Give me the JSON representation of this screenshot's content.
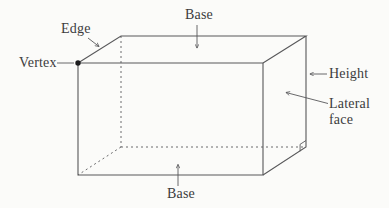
{
  "figure": {
    "type": "labeled-geometry-diagram",
    "labels": {
      "base_top": "Base",
      "edge": "Edge",
      "vertex": "Vertex",
      "height": "Height",
      "lateral_face": "Lateral face",
      "base_bottom": "Base"
    }
  },
  "colors": {
    "background": "#fbfbf9",
    "line": "#58585a",
    "dashed_line": "#6a6a6c",
    "text": "#3b3b3d",
    "vertex_dot": "#1c1c1e"
  }
}
